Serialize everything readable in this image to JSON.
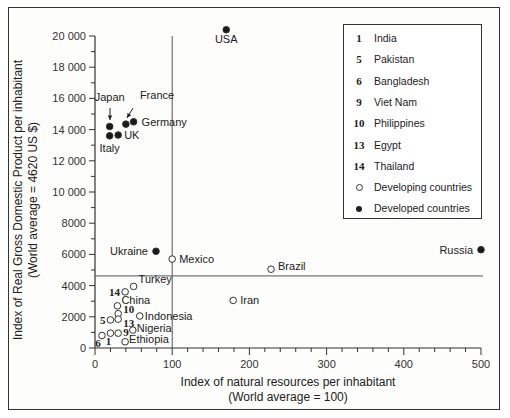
{
  "chart_data": {
    "type": "scatter",
    "title": "",
    "xlabel": "Index of natural resources per inhabitant (World average = 100)",
    "ylabel": "Index of Real Gross Domestic Product per inhabitant (World average = 4620 US $)",
    "xlabel_lines": [
      "Index of natural resources per inhabitant",
      "(World average = 100)"
    ],
    "ylabel_lines": [
      "Index of Real Gross Domestic Product per inhabitant",
      "(World average = 4620 US $)"
    ],
    "xlim": [
      0,
      500
    ],
    "ylim": [
      0,
      20000
    ],
    "x_ticks": [
      "0",
      "100",
      "200",
      "300",
      "400",
      "500"
    ],
    "y_ticks": [
      "0",
      "2000",
      "4000",
      "6000",
      "8000",
      "10 000",
      "12 000",
      "14 000",
      "16 000",
      "18 000",
      "20 000"
    ],
    "reference_lines": {
      "vertical_x": 100,
      "horizontal_y": 4620
    },
    "grid": false,
    "legend_position": "top-right",
    "series": [
      {
        "name": "Developed countries",
        "marker": "filled",
        "points": [
          {
            "label": "USA",
            "x": 170,
            "y": 20400
          },
          {
            "label": "Japan",
            "x": 19,
            "y": 14200
          },
          {
            "label": "France",
            "x": 40,
            "y": 14350
          },
          {
            "label": "Germany",
            "x": 50,
            "y": 14500
          },
          {
            "label": "UK",
            "x": 30,
            "y": 13650
          },
          {
            "label": "Italy",
            "x": 19,
            "y": 13600
          },
          {
            "label": "Ukraine",
            "x": 79,
            "y": 6200
          },
          {
            "label": "Russia",
            "x": 500,
            "y": 6300
          }
        ]
      },
      {
        "name": "Developing countries",
        "marker": "open",
        "points": [
          {
            "label": "Mexico",
            "x": 100,
            "y": 5700
          },
          {
            "label": "Brazil",
            "x": 228,
            "y": 5050
          },
          {
            "label": "Iran",
            "x": 179,
            "y": 3050
          },
          {
            "label": "Turkey",
            "x": 50,
            "y": 3950
          },
          {
            "label": "14",
            "name": "Thailand",
            "x": 39,
            "y": 3600
          },
          {
            "label": "China",
            "x": 29,
            "y": 2700
          },
          {
            "label": "10",
            "name": "Philippines",
            "x": 30,
            "y": 2200
          },
          {
            "label": "5",
            "name": "Pakistan",
            "x": 20,
            "y": 1800
          },
          {
            "label": "13",
            "name": "Egypt",
            "x": 30,
            "y": 1850
          },
          {
            "label": "Indonesia",
            "x": 58,
            "y": 2050
          },
          {
            "label": "Nigeria",
            "x": 49,
            "y": 1150
          },
          {
            "label": "9",
            "name": "Viet Nam",
            "x": 30,
            "y": 950
          },
          {
            "label": "1",
            "name": "India",
            "x": 20,
            "y": 950
          },
          {
            "label": "6",
            "name": "Bangladesh",
            "x": 9,
            "y": 800
          },
          {
            "label": "Ethiopia",
            "x": 39,
            "y": 400
          }
        ]
      }
    ]
  },
  "legend": {
    "items": [
      {
        "key": "1",
        "text": "India"
      },
      {
        "key": "5",
        "text": "Pakistan"
      },
      {
        "key": "6",
        "text": "Bangladesh"
      },
      {
        "key": "9",
        "text": "Viet Nam"
      },
      {
        "key": "10",
        "text": "Philippines"
      },
      {
        "key": "13",
        "text": "Egypt"
      },
      {
        "key": "14",
        "text": "Thailand"
      }
    ],
    "developing": "Developing countries",
    "developed": "Developed countries"
  }
}
